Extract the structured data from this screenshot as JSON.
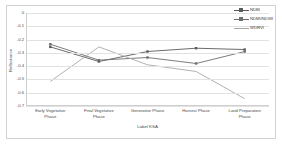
{
  "chart_data": {
    "type": "line",
    "title": "",
    "xlabel": "Label KSA",
    "ylabel": "Reflectance",
    "categories": [
      "Early Vegetative\nPhase",
      "Final Vegetative\nPhase",
      "Generative Phase",
      "Harvest Phase",
      "Land Preparation\nPhase"
    ],
    "ylim": [
      -0.7,
      0.0
    ],
    "yticks": [
      "0",
      "-0.1",
      "-0.2",
      "-0.3",
      "-0.4",
      "-0.5",
      "-0.6",
      "-0.7"
    ],
    "ytick_values": [
      0,
      -0.1,
      -0.2,
      -0.3,
      -0.4,
      -0.5,
      -0.6,
      -0.7
    ],
    "grid": true,
    "legend_position": "top-right",
    "series": [
      {
        "name": "NDBI",
        "color": "#5a5a5a",
        "marker": "square",
        "values": [
          -0.255,
          -0.365,
          -0.29,
          -0.265,
          -0.275
        ]
      },
      {
        "name": "NDMI/NDWI",
        "color": "#6e6e6e",
        "marker": "square",
        "values": [
          -0.235,
          -0.355,
          -0.335,
          -0.38,
          -0.29
        ]
      },
      {
        "name": "WDRVI",
        "color": "#a8a8a8",
        "marker": "none",
        "values": [
          -0.515,
          -0.255,
          -0.39,
          -0.44,
          -0.645
        ]
      }
    ]
  },
  "legend": {
    "items": [
      {
        "label": "NDBI"
      },
      {
        "label": "NDMI/NDWI"
      },
      {
        "label": "WDRVI"
      }
    ]
  }
}
